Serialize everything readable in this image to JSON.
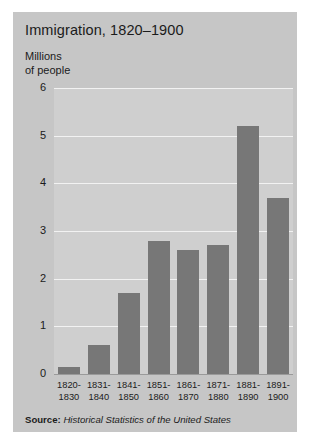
{
  "chart_data": {
    "type": "bar",
    "title": "Immigration, 1820–1900",
    "ylabel_line1": "Millions",
    "ylabel_line2": "of people",
    "xlabel": "",
    "ylim": [
      0,
      6
    ],
    "yticks": [
      "0",
      "1",
      "2",
      "3",
      "4",
      "5",
      "6"
    ],
    "grid": true,
    "legend": "none",
    "categories": [
      "1820–\n1830",
      "1831–\n1840",
      "1841–\n1850",
      "1851–\n1860",
      "1861–\n1870",
      "1871–\n1880",
      "1881–\n1890",
      "1891–\n1900"
    ],
    "category_lines": [
      [
        "1820-",
        "1830"
      ],
      [
        "1831-",
        "1840"
      ],
      [
        "1841-",
        "1850"
      ],
      [
        "1851-",
        "1860"
      ],
      [
        "1861-",
        "1870"
      ],
      [
        "1871-",
        "1880"
      ],
      [
        "1881-",
        "1890"
      ],
      [
        "1891-",
        "1900"
      ]
    ],
    "values": [
      0.15,
      0.6,
      1.7,
      2.8,
      2.6,
      2.7,
      5.2,
      3.7
    ],
    "bar_color": "#777777",
    "panel_color": "#cfcfcf",
    "figure_color": "#c6c6c6",
    "gridline_color": "#f2f2f2"
  },
  "source": {
    "prefix": "Source:",
    "text": "Historical Statistics of the United States"
  }
}
